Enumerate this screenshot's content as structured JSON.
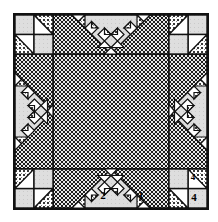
{
  "diagram": {
    "type": "quilt-block-pattern",
    "shape": "square",
    "grid": "5x5 unit star block with sawtooth chevron arms",
    "border_color": "#111111",
    "fabrics": [
      {
        "name": "light-solid",
        "color": "#d9d9d9",
        "pattern": "plain light gray"
      },
      {
        "name": "medium-dot",
        "color": "#b5b5b5",
        "pattern": "fine dotted / pin-dot"
      },
      {
        "name": "dark-check",
        "color": "#6b6b6b",
        "pattern": "dense checkered"
      },
      {
        "name": "white",
        "color": "#ffffff",
        "pattern": "white background"
      }
    ],
    "piece_labels": [
      {
        "id": "label-1",
        "text": "1",
        "location": "bottom-center-right small triangle"
      },
      {
        "id": "label-2",
        "text": "2",
        "location": "bottom-center large light triangle"
      },
      {
        "id": "label-4a",
        "text": "4",
        "location": "bottom-right upper unit"
      },
      {
        "id": "label-4b",
        "text": "4",
        "location": "bottom-right corner square"
      }
    ],
    "regions": [
      {
        "name": "center-square",
        "fabric": "dark-check"
      },
      {
        "name": "top-chevron",
        "fabric": "light-solid"
      },
      {
        "name": "bottom-chevron",
        "fabric": "light-solid"
      },
      {
        "name": "left-chevron",
        "fabric": "light-solid"
      },
      {
        "name": "right-chevron",
        "fabric": "light-solid"
      },
      {
        "name": "corner-four-patch",
        "fabric": "light-solid + medium-dot"
      }
    ]
  }
}
